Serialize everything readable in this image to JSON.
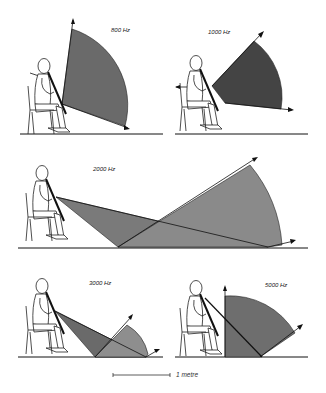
{
  "diagram": {
    "panels": [
      {
        "id": "800",
        "label": "800 Hz"
      },
      {
        "id": "1000",
        "label": "1000 Hz"
      },
      {
        "id": "2000",
        "label": "2000 Hz"
      },
      {
        "id": "3000",
        "label": "3000 Hz"
      },
      {
        "id": "5000",
        "label": "5000 Hz"
      }
    ],
    "scale_bar": {
      "label": "1 metre"
    },
    "colors": {
      "sector_dark": "#4a4a4a",
      "sector_medium": "#6e6e6e",
      "sector_light": "#8a8a8a",
      "line": "#111111",
      "background": "#ffffff"
    }
  }
}
